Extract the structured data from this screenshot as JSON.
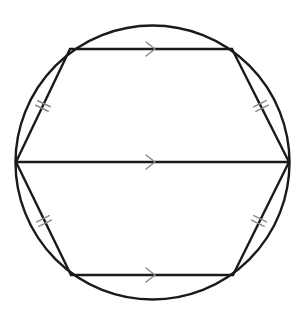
{
  "diagram": {
    "colors": {
      "line": "#1a1a1a",
      "marks": "#8a8a8a",
      "background": "#ffffff"
    },
    "circle": {
      "cx": 152.5,
      "cy": 162.5,
      "r": 137
    },
    "vertices": {
      "top_left": [
        70,
        49
      ],
      "top_right": [
        232,
        49
      ],
      "right": [
        289,
        162
      ],
      "bottom_right": [
        233,
        275
      ],
      "bottom_left": [
        71,
        275
      ],
      "left": [
        16,
        162
      ]
    },
    "parallel_lines": [
      {
        "name": "top-chord",
        "from": [
          70,
          49
        ],
        "to": [
          232,
          49
        ],
        "arrow_at": [
          153,
          49
        ]
      },
      {
        "name": "diameter",
        "from": [
          16,
          162
        ],
        "to": [
          289,
          162
        ],
        "arrow_at": [
          153,
          162
        ]
      },
      {
        "name": "bottom-chord",
        "from": [
          71,
          275
        ],
        "to": [
          233,
          275
        ],
        "arrow_at": [
          153,
          275
        ]
      }
    ],
    "equal_sides": [
      {
        "name": "upper-left-side",
        "from": [
          16,
          162
        ],
        "to": [
          70,
          49
        ],
        "tick_at": [
          43,
          106
        ]
      },
      {
        "name": "upper-right-side",
        "from": [
          232,
          49
        ],
        "to": [
          289,
          162
        ],
        "tick_at": [
          261,
          106
        ]
      },
      {
        "name": "lower-left-side",
        "from": [
          16,
          162
        ],
        "to": [
          71,
          275
        ],
        "tick_at": [
          44,
          221
        ]
      },
      {
        "name": "lower-right-side",
        "from": [
          289,
          162
        ],
        "to": [
          233,
          275
        ],
        "tick_at": [
          259,
          221
        ]
      }
    ],
    "tick_style": "double-hash",
    "arrow_style": "open-chevron-right"
  }
}
